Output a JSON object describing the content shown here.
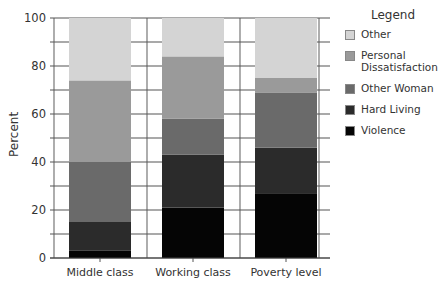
{
  "chart_data": {
    "type": "bar",
    "stacked": true,
    "title": "",
    "xlabel": "",
    "ylabel": "Percent",
    "ylim": [
      0,
      100
    ],
    "yticks": [
      0,
      20,
      40,
      60,
      80,
      100
    ],
    "minor_tick_step": 10,
    "grid": true,
    "legend_position": "right",
    "legend_title": "Legend",
    "categories": [
      "Middle class",
      "Working class",
      "Poverty level"
    ],
    "series": [
      {
        "name": "Violence",
        "color": "#050505",
        "values": [
          3,
          21,
          27
        ]
      },
      {
        "name": "Hard Living",
        "color": "#2b2b2b",
        "values": [
          12,
          22,
          19
        ]
      },
      {
        "name": "Other Woman",
        "color": "#6a6a6a",
        "values": [
          25,
          15,
          23
        ]
      },
      {
        "name": "Personal Dissatisfaction",
        "color": "#9a9a9a",
        "values": [
          34,
          26,
          6
        ]
      },
      {
        "name": "Other",
        "color": "#d4d4d4",
        "values": [
          26,
          16,
          25
        ]
      }
    ]
  },
  "legend": {
    "title": "Legend",
    "items": [
      {
        "label": "Other",
        "color": "#d4d4d4"
      },
      {
        "label": "Personal Dissatisfaction",
        "color": "#9a9a9a"
      },
      {
        "label": "Other Woman",
        "color": "#6a6a6a"
      },
      {
        "label": "Hard Living",
        "color": "#2b2b2b"
      },
      {
        "label": "Violence",
        "color": "#050505"
      }
    ]
  },
  "axis": {
    "ylabel": "Percent"
  }
}
